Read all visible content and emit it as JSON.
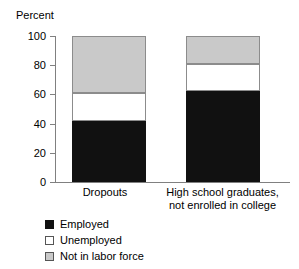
{
  "chart_data": {
    "type": "bar",
    "subtype": "stacked-100-percent",
    "title": "",
    "xlabel": "",
    "ylabel": "Percent",
    "ylim": [
      0,
      100
    ],
    "yticks": [
      0,
      20,
      40,
      60,
      80,
      100
    ],
    "ytick_labels": [
      "0",
      "20",
      "40",
      "60",
      "80",
      "100"
    ],
    "grid": false,
    "legend_position": "bottom-left",
    "categories": [
      "Dropouts",
      "High school graduates, not enrolled in college"
    ],
    "category_label_lines": [
      [
        "Dropouts"
      ],
      [
        "High school graduates,",
        "not enrolled in college"
      ]
    ],
    "series": [
      {
        "name": "Employed",
        "color": "#111111",
        "values": [
          42,
          62
        ]
      },
      {
        "name": "Unemployed",
        "color": "#ffffff",
        "values": [
          19,
          19
        ]
      },
      {
        "name": "Not in labor force",
        "color": "#c9c9c9",
        "values": [
          39,
          19
        ]
      }
    ],
    "stack_boundaries": [
      {
        "category": "Dropouts",
        "employed_top": 42,
        "unemployed_top": 61,
        "notinlabor_top": 100
      },
      {
        "category": "High school graduates, not enrolled in college",
        "employed_top": 62,
        "unemployed_top": 81,
        "notinlabor_top": 100
      }
    ]
  },
  "legend": {
    "items": [
      {
        "label": "Employed"
      },
      {
        "label": "Unemployed"
      },
      {
        "label": "Not in labor force"
      }
    ]
  }
}
